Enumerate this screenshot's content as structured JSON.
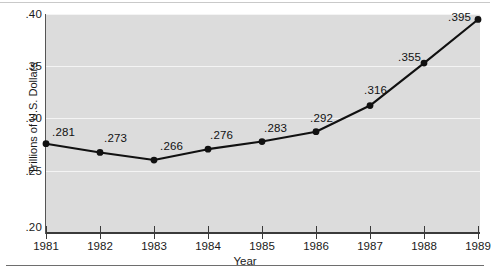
{
  "chart_data": {
    "type": "line",
    "title": "",
    "subtitle": "",
    "xlabel": "Year",
    "ylabel": "Trillions of U.S. Dollars",
    "categories": [
      "1981",
      "1982",
      "1983",
      "1984",
      "1985",
      "1986",
      "1987",
      "1988",
      "1989"
    ],
    "x": [
      1981,
      1982,
      1983,
      1984,
      1985,
      1986,
      1987,
      1988,
      1989
    ],
    "values": [
      0.281,
      0.273,
      0.266,
      0.276,
      0.283,
      0.292,
      0.316,
      0.355,
      0.395
    ],
    "point_labels": [
      ".281",
      ".273",
      ".266",
      ".276",
      ".283",
      ".292",
      ".316",
      ".355",
      ".395"
    ],
    "ylim": [
      0.2,
      0.4
    ],
    "xlim": [
      1981,
      1989
    ],
    "ytick_labels": [
      ".40",
      ".35",
      ".30",
      ".25",
      ".20"
    ],
    "ytick_values": [
      0.4,
      0.35,
      0.3,
      0.25,
      0.2
    ],
    "grid": "horizontal",
    "legend": "none",
    "series": [
      {
        "name": "Trillions of U.S. Dollars",
        "values": [
          0.281,
          0.273,
          0.266,
          0.276,
          0.283,
          0.292,
          0.316,
          0.355,
          0.395
        ]
      }
    ],
    "colors": {
      "line": "#111111",
      "marker": "#111111",
      "plot_background": "#dcdcdc",
      "gridline": "#f4f4f4",
      "axis": "#3a3a3a",
      "page_background": "#ffffff"
    }
  }
}
